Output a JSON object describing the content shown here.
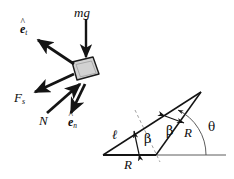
{
  "figure": {
    "background_color": "#ffffff",
    "ink_color": "#141414",
    "block_fill_color": "#d0d0d0",
    "thin_line_color": "#6e6e6e"
  },
  "free_body": {
    "block_label": "block",
    "labels": {
      "weight": "mg",
      "friction": "F",
      "friction_sub": "s",
      "normal": "N",
      "unit_tangent_base": "e",
      "unit_tangent_sub": "t",
      "unit_tangent_hat": "^",
      "unit_normal_base": "e",
      "unit_normal_sub": "n",
      "unit_normal_hat": "^"
    },
    "vectors": [
      {
        "name": "mg",
        "description": "weight, arrow pointing straight down onto block"
      },
      {
        "name": "e_t",
        "description": "unit tangent vector, arrow pointing up-left"
      },
      {
        "name": "F_s",
        "description": "friction force, arrow pointing down-left"
      },
      {
        "name": "N",
        "description": "normal force, arrow pointing up-right into block"
      },
      {
        "name": "e_n",
        "description": "unit normal vector, arrow pointing down-right"
      }
    ]
  },
  "geometry": {
    "labels": {
      "side_ell": "ℓ",
      "base_R": "R",
      "slant_R": "R",
      "beta_lower": "β",
      "beta_upper": "β",
      "theta": "θ"
    },
    "angles": [
      {
        "symbol": "β",
        "description": "angle between base and long side at lower-left region"
      },
      {
        "symbol": "β",
        "description": "angle between dashed bisector and slant side R"
      },
      {
        "symbol": "θ",
        "description": "angle from horizontal baseline to slant side R"
      }
    ],
    "lengths": [
      {
        "symbol": "ℓ",
        "description": "long upper-left side of triangle"
      },
      {
        "symbol": "R",
        "description": "horizontal base segment"
      },
      {
        "symbol": "R",
        "description": "slant side from base to apex"
      }
    ]
  }
}
